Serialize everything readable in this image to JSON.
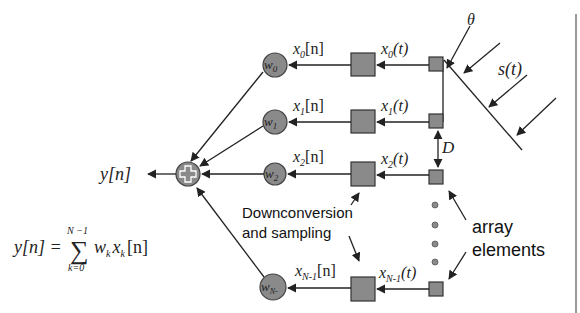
{
  "diagram": {
    "incident_signal": {
      "label": "s(t)",
      "angle_label": "θ"
    },
    "spacing_label": "D",
    "output": {
      "label": "y[n]"
    },
    "equation": {
      "lhs": "y[n] =",
      "sum_upper": "N −1",
      "sum_lower": "k=0",
      "body": "w",
      "body_sub": "k",
      "body2": "x",
      "body2_sub": "k",
      "body_tail": "[n]"
    },
    "annotations": {
      "downconversion_line1": "Downconversion",
      "downconversion_line2": "and sampling",
      "array_line1": "array",
      "array_line2": "elements"
    },
    "channels": [
      {
        "weight": "w",
        "weight_sub": "0",
        "digital": "x",
        "digital_sub": "0",
        "digital_tail": "[n]",
        "analog": "x",
        "analog_sub": "0",
        "analog_tail": "(t)"
      },
      {
        "weight": "w",
        "weight_sub": "1",
        "digital": "x",
        "digital_sub": "1",
        "digital_tail": "[n]",
        "analog": "x",
        "analog_sub": "1",
        "analog_tail": "(t)"
      },
      {
        "weight": "w",
        "weight_sub": "2",
        "digital": "x",
        "digital_sub": "2",
        "digital_tail": "[n]",
        "analog": "x",
        "analog_sub": "2",
        "analog_tail": "(t)"
      },
      {
        "weight": "w",
        "weight_sub": "N-",
        "digital": "x",
        "digital_sub": "N-1",
        "digital_tail": "[n]",
        "analog": "x",
        "analog_sub": "N-1",
        "analog_tail": "(t)"
      }
    ],
    "summer_symbol": "+",
    "colors": {
      "node_fill": "#8a8a8a",
      "line": "#222222",
      "background": "#ffffff"
    }
  }
}
